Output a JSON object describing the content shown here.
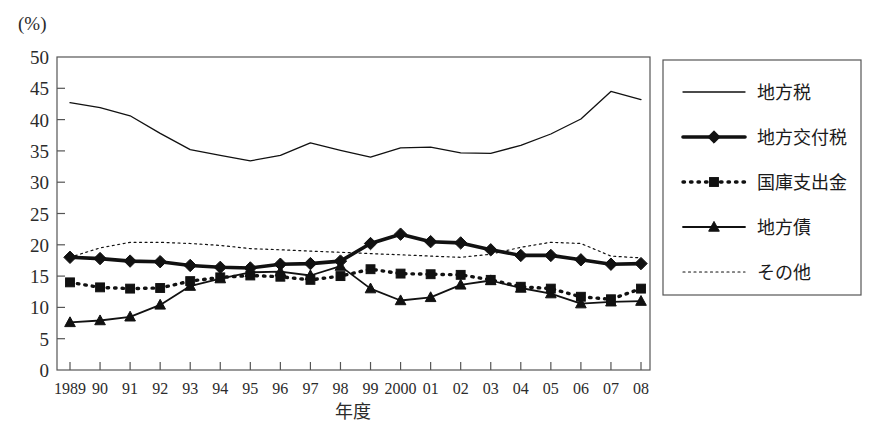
{
  "chart_data": {
    "type": "line",
    "title": "",
    "ylabel": "(%)",
    "xlabel": "年度",
    "ylim": [
      0,
      50
    ],
    "ytick_step": 5,
    "yticks": [
      "0",
      "5",
      "10",
      "15",
      "20",
      "25",
      "30",
      "35",
      "40",
      "45",
      "50"
    ],
    "grid": false,
    "legend_position": "right",
    "categories": [
      "1989",
      "90",
      "91",
      "92",
      "93",
      "94",
      "95",
      "96",
      "97",
      "98",
      "99",
      "2000",
      "01",
      "02",
      "03",
      "04",
      "05",
      "06",
      "07",
      "08"
    ],
    "series": [
      {
        "name": "地方税",
        "style": "thin-solid",
        "marker": "none",
        "values": [
          42.7,
          41.9,
          40.6,
          37.8,
          35.2,
          34.3,
          33.4,
          34.3,
          36.3,
          35.1,
          34.0,
          35.5,
          35.6,
          34.7,
          34.6,
          35.9,
          37.7,
          40.1,
          44.5,
          43.2
        ]
      },
      {
        "name": "地方交付税",
        "style": "thick-solid",
        "marker": "diamond",
        "values": [
          18.0,
          17.8,
          17.4,
          17.3,
          16.7,
          16.4,
          16.3,
          16.9,
          17.0,
          17.4,
          20.2,
          21.7,
          20.5,
          20.3,
          19.2,
          18.3,
          18.3,
          17.6,
          16.9,
          17.0
        ]
      },
      {
        "name": "国庫支出金",
        "style": "dotted",
        "marker": "square",
        "values": [
          14.0,
          13.2,
          13.0,
          13.1,
          14.2,
          14.8,
          15.1,
          14.9,
          14.4,
          15.0,
          16.1,
          15.4,
          15.3,
          15.2,
          14.4,
          13.3,
          13.0,
          11.7,
          11.3,
          13.0
        ]
      },
      {
        "name": "地方債",
        "style": "solid",
        "marker": "triangle",
        "values": [
          7.6,
          7.9,
          8.5,
          10.4,
          13.4,
          14.6,
          15.6,
          15.7,
          15.1,
          16.6,
          13.0,
          11.1,
          11.6,
          13.6,
          14.3,
          13.1,
          12.2,
          10.6,
          10.9,
          11.0
        ]
      },
      {
        "name": "その他",
        "style": "fine-dotted",
        "marker": "none",
        "values": [
          18.0,
          19.5,
          20.4,
          20.4,
          20.2,
          19.9,
          19.4,
          19.2,
          19.0,
          18.8,
          18.6,
          18.4,
          18.2,
          18.0,
          18.5,
          19.6,
          20.4,
          20.2,
          18.2,
          17.9
        ]
      }
    ]
  },
  "legend": {
    "items": [
      {
        "label": "地方税"
      },
      {
        "label": "地方交付税"
      },
      {
        "label": "国庫支出金"
      },
      {
        "label": "地方債"
      },
      {
        "label": "その他"
      }
    ]
  }
}
